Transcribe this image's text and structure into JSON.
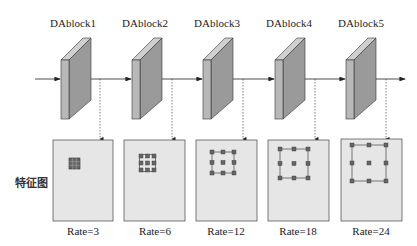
{
  "diagram": {
    "row_label": "特征图",
    "colors": {
      "block_front": "#b8b8b8",
      "block_side": "#9a9a9a",
      "block_top": "#cfcfcf",
      "map_fill": "#e6e6e6",
      "stroke": "#333333",
      "kernel": "#555555"
    },
    "blocks": [
      {
        "label": "DAblock1",
        "rate_label": "Rate=3",
        "rate": 3
      },
      {
        "label": "DAblock2",
        "rate_label": "Rate=6",
        "rate": 6
      },
      {
        "label": "DAblock3",
        "rate_label": "Rate=12",
        "rate": 12
      },
      {
        "label": "DAblock4",
        "rate_label": "Rate=18",
        "rate": 18
      },
      {
        "label": "DAblock5",
        "rate_label": "Rate=24",
        "rate": 24
      }
    ]
  }
}
